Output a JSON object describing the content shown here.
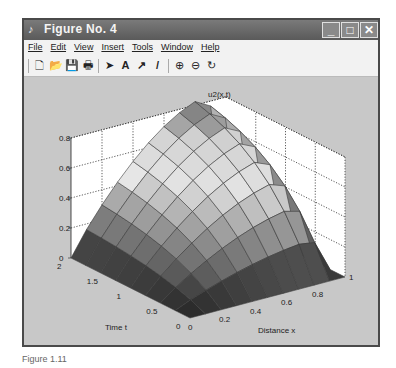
{
  "window": {
    "title": "Figure No. 4",
    "controls": {
      "minimize": "_",
      "maximize": "□",
      "close": "✕"
    }
  },
  "menubar": {
    "items": [
      "File",
      "Edit",
      "View",
      "Insert",
      "Tools",
      "Window",
      "Help"
    ]
  },
  "toolbar": {
    "tools": [
      {
        "name": "new-figure-icon",
        "glyph": "🗋"
      },
      {
        "name": "open-file-icon",
        "glyph": "📂"
      },
      {
        "name": "save-icon",
        "glyph": "💾"
      },
      {
        "name": "print-icon",
        "glyph": "🖶"
      },
      {
        "name": "edit-plot-arrow-icon",
        "glyph": "➤"
      },
      {
        "name": "insert-text-icon",
        "glyph": "A"
      },
      {
        "name": "insert-arrow-icon",
        "glyph": "↗"
      },
      {
        "name": "insert-line-icon",
        "glyph": "/"
      },
      {
        "name": "zoom-in-icon",
        "glyph": "⊕"
      },
      {
        "name": "zoom-out-icon",
        "glyph": "⊖"
      },
      {
        "name": "rotate-3d-icon",
        "glyph": "↻"
      }
    ]
  },
  "chart_data": {
    "type": "surface",
    "title": "u2(x,t)",
    "xlabel": "Distance x",
    "ylabel": "Time t",
    "zlabel": "",
    "x_ticks": [
      "0",
      "0.2",
      "0.4",
      "0.6",
      "0.8",
      "1"
    ],
    "t_ticks": [
      "0",
      "0.5",
      "1",
      "1.5",
      "2"
    ],
    "z_ticks": [
      "0",
      "0.2",
      "0.4",
      "0.6",
      "0.8"
    ],
    "xlim": [
      0,
      1
    ],
    "tlim": [
      0,
      2
    ],
    "zlim": [
      0,
      0.8
    ],
    "grid": true,
    "x": [
      0,
      0.1,
      0.2,
      0.3,
      0.4,
      0.5,
      0.6,
      0.7,
      0.8,
      0.9,
      1.0
    ],
    "t": [
      0,
      0.25,
      0.5,
      0.75,
      1.0,
      1.25,
      1.5,
      1.75,
      2.0
    ]
  },
  "caption": "Figure 1.11"
}
